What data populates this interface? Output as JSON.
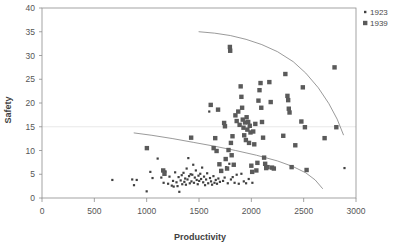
{
  "chart_data": {
    "type": "scatter",
    "title": "",
    "xlabel": "Productivity",
    "ylabel": "Safety",
    "xlim": [
      0,
      3000
    ],
    "ylim": [
      0,
      40
    ],
    "xticks": [
      0,
      500,
      1000,
      1500,
      2000,
      2500,
      3000
    ],
    "yticks": [
      0,
      5,
      10,
      15,
      20,
      25,
      30,
      35,
      40
    ],
    "grid": "horizontal-single-at-15",
    "legend_position": "top-right-outside",
    "series": [
      {
        "name": "1923",
        "marker": "dot",
        "color": "#404040",
        "points": [
          [
            672,
            3.8
          ],
          [
            862,
            3.9
          ],
          [
            879,
            2.7
          ],
          [
            905,
            3.8
          ],
          [
            1000,
            1.4
          ],
          [
            1035,
            5.5
          ],
          [
            1056,
            4.2
          ],
          [
            1105,
            8.3
          ],
          [
            1140,
            4.3
          ],
          [
            1162,
            3.2
          ],
          [
            1180,
            5.6
          ],
          [
            1205,
            3.0
          ],
          [
            1218,
            4.5
          ],
          [
            1240,
            2.6
          ],
          [
            1252,
            3.6
          ],
          [
            1258,
            2.4
          ],
          [
            1272,
            5.4
          ],
          [
            1285,
            3.3
          ],
          [
            1295,
            2.5
          ],
          [
            1305,
            4.4
          ],
          [
            1312,
            1.3
          ],
          [
            1325,
            3.7
          ],
          [
            1335,
            4.8
          ],
          [
            1340,
            2.9
          ],
          [
            1352,
            5.3
          ],
          [
            1360,
            3.4
          ],
          [
            1368,
            4.1
          ],
          [
            1375,
            2.8
          ],
          [
            1382,
            6.2
          ],
          [
            1390,
            3.9
          ],
          [
            1398,
            8.4
          ],
          [
            1405,
            4.6
          ],
          [
            1412,
            3.1
          ],
          [
            1420,
            5.0
          ],
          [
            1428,
            3.5
          ],
          [
            1436,
            4.9
          ],
          [
            1445,
            7.0
          ],
          [
            1452,
            3.2
          ],
          [
            1460,
            4.3
          ],
          [
            1470,
            5.8
          ],
          [
            1478,
            3.8
          ],
          [
            1488,
            2.9
          ],
          [
            1495,
            4.7
          ],
          [
            1502,
            3.6
          ],
          [
            1512,
            5.1
          ],
          [
            1520,
            4.0
          ],
          [
            1530,
            6.4
          ],
          [
            1540,
            3.3
          ],
          [
            1548,
            4.5
          ],
          [
            1558,
            2.7
          ],
          [
            1568,
            3.9
          ],
          [
            1578,
            5.2
          ],
          [
            1588,
            3.1
          ],
          [
            1598,
            18.2
          ],
          [
            1605,
            4.2
          ],
          [
            1615,
            3.5
          ],
          [
            1625,
            2.8
          ],
          [
            1638,
            4.6
          ],
          [
            1648,
            3.2
          ],
          [
            1660,
            3.8
          ],
          [
            1672,
            3.0
          ],
          [
            1685,
            4.1
          ],
          [
            1700,
            3.4
          ],
          [
            1715,
            5.9
          ],
          [
            1730,
            3.6
          ],
          [
            1745,
            4.3
          ],
          [
            1760,
            6.5
          ],
          [
            1775,
            3.1
          ],
          [
            1790,
            7.2
          ],
          [
            1805,
            3.9
          ],
          [
            1822,
            4.4
          ],
          [
            1840,
            3.2
          ],
          [
            1860,
            4.9
          ],
          [
            1880,
            3.0
          ],
          [
            1905,
            5.1
          ],
          [
            1928,
            3.5
          ],
          [
            1950,
            3.1
          ],
          [
            1975,
            4.0
          ],
          [
            2010,
            3.2
          ],
          [
            2890,
            6.3
          ]
        ]
      },
      {
        "name": "1939",
        "marker": "square",
        "color": "#5a5a5a",
        "points": [
          [
            1002,
            10.5
          ],
          [
            1158,
            5.8
          ],
          [
            1170,
            5.1
          ],
          [
            1425,
            12.7
          ],
          [
            1612,
            19.6
          ],
          [
            1640,
            10.5
          ],
          [
            1655,
            12.6
          ],
          [
            1668,
            9.9
          ],
          [
            1682,
            18.6
          ],
          [
            1695,
            7.1
          ],
          [
            1712,
            5.7
          ],
          [
            1740,
            15.8
          ],
          [
            1748,
            15.1
          ],
          [
            1755,
            8.2
          ],
          [
            1768,
            6.2
          ],
          [
            1782,
            10.1
          ],
          [
            1795,
            31.8
          ],
          [
            1798,
            31.0
          ],
          [
            1805,
            11.6
          ],
          [
            1812,
            9.0
          ],
          [
            1820,
            13.0
          ],
          [
            1832,
            7.0
          ],
          [
            1848,
            17.4
          ],
          [
            1860,
            16.2
          ],
          [
            1875,
            18.2
          ],
          [
            1888,
            15.4
          ],
          [
            1898,
            23.5
          ],
          [
            1905,
            21.3
          ],
          [
            1912,
            19.0
          ],
          [
            1918,
            16.5
          ],
          [
            1925,
            14.8
          ],
          [
            1932,
            13.2
          ],
          [
            1940,
            15.9
          ],
          [
            1948,
            12.2
          ],
          [
            1955,
            17.0
          ],
          [
            1962,
            14.4
          ],
          [
            1970,
            16.0
          ],
          [
            1978,
            11.6
          ],
          [
            1985,
            15.2
          ],
          [
            1992,
            13.8
          ],
          [
            2000,
            6.8
          ],
          [
            2008,
            5.5
          ],
          [
            2018,
            14.0
          ],
          [
            2028,
            11.3
          ],
          [
            2038,
            15.6
          ],
          [
            2048,
            5.8
          ],
          [
            2058,
            7.4
          ],
          [
            2068,
            20.5
          ],
          [
            2078,
            22.7
          ],
          [
            2088,
            24.2
          ],
          [
            2095,
            19.0
          ],
          [
            2102,
            16.0
          ],
          [
            2112,
            12.7
          ],
          [
            2122,
            8.5
          ],
          [
            2132,
            7.2
          ],
          [
            2142,
            6.3
          ],
          [
            2155,
            6.5
          ],
          [
            2172,
            24.4
          ],
          [
            2185,
            20.2
          ],
          [
            2198,
            6.4
          ],
          [
            2215,
            6.2
          ],
          [
            2305,
            13.1
          ],
          [
            2325,
            26.1
          ],
          [
            2345,
            21.5
          ],
          [
            2352,
            20.6
          ],
          [
            2358,
            18.8
          ],
          [
            2365,
            18.0
          ],
          [
            2385,
            6.5
          ],
          [
            2420,
            11.1
          ],
          [
            2478,
            16.1
          ],
          [
            2492,
            23.3
          ],
          [
            2512,
            14.9
          ],
          [
            2528,
            5.9
          ],
          [
            2700,
            12.6
          ],
          [
            2795,
            27.5
          ],
          [
            2812,
            14.9
          ]
        ]
      }
    ],
    "curves": [
      {
        "name": "upper-frontier-1939",
        "color": "#6e6e6e",
        "points": [
          [
            1500,
            35.0
          ],
          [
            1650,
            34.7
          ],
          [
            1800,
            34.2
          ],
          [
            1950,
            33.4
          ],
          [
            2100,
            32.3
          ],
          [
            2250,
            30.8
          ],
          [
            2400,
            28.7
          ],
          [
            2520,
            26.3
          ],
          [
            2640,
            23.2
          ],
          [
            2740,
            19.9
          ],
          [
            2820,
            16.6
          ],
          [
            2880,
            13.3
          ]
        ]
      },
      {
        "name": "lower-frontier-1923",
        "color": "#6e6e6e",
        "points": [
          [
            880,
            13.7
          ],
          [
            1050,
            13.2
          ],
          [
            1250,
            12.5
          ],
          [
            1450,
            11.7
          ],
          [
            1650,
            10.9
          ],
          [
            1850,
            10.0
          ],
          [
            2050,
            9.0
          ],
          [
            2250,
            7.8
          ],
          [
            2400,
            6.6
          ],
          [
            2520,
            5.3
          ],
          [
            2610,
            3.8
          ],
          [
            2680,
            2.0
          ]
        ]
      }
    ]
  },
  "legend": {
    "entries": [
      {
        "label": "1923",
        "marker": "dot",
        "color": "#404040"
      },
      {
        "label": "1939",
        "marker": "square",
        "color": "#5a5a5a"
      }
    ]
  }
}
